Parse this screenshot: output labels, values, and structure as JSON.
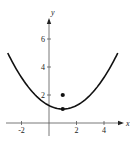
{
  "chart_data": {
    "type": "line",
    "title": "",
    "xlabel": "x",
    "ylabel": "y",
    "xlim": [
      -3,
      5.5
    ],
    "ylim": [
      -1.2,
      7.2
    ],
    "grid": false,
    "legend": null,
    "x_ticks": [
      -2,
      2,
      4
    ],
    "y_ticks": [
      2,
      4,
      6
    ],
    "x_tick_labels": [
      "-2",
      "2",
      "4"
    ],
    "y_tick_labels": [
      "2",
      "4",
      "6"
    ],
    "series": [
      {
        "name": "parabola",
        "equation": "y = 0.25(x - 1)^2 + 1",
        "x": [
          -3,
          -2,
          -1,
          0,
          1,
          2,
          3,
          4,
          5
        ],
        "y": [
          5,
          3.25,
          2,
          1.25,
          1,
          1.25,
          2,
          3.25,
          5
        ]
      }
    ],
    "points": [
      {
        "name": "vertex",
        "x": 1,
        "y": 1
      },
      {
        "name": "focus",
        "x": 1,
        "y": 2
      }
    ]
  },
  "axes": {
    "x_label": "x",
    "y_label": "y"
  },
  "colors": {
    "curve": "#111111",
    "axis": "#555555",
    "point": "#111111"
  }
}
